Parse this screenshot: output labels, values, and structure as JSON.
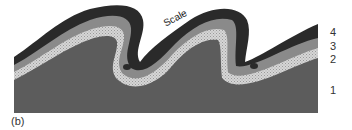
{
  "figure": {
    "caption": "(b)",
    "scale_label": "Scale",
    "layers": [
      {
        "id": "1",
        "label": "1",
        "color": "#5c5c5c"
      },
      {
        "id": "2",
        "label": "2",
        "color": "#cfcfcf"
      },
      {
        "id": "3",
        "label": "3",
        "color": "#8a8a8a"
      },
      {
        "id": "4",
        "label": "4",
        "color": "#2a2a2a"
      }
    ]
  }
}
